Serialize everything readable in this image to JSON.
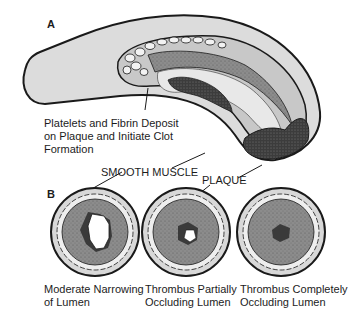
{
  "panels": {
    "a": {
      "letter": "A",
      "annotation": "Platelets and Fibrin Deposit\non Plaque and Initiate Clot\nFormation",
      "annotation_lines": [
        "Platelets and Fibrin Deposit",
        "on Plaque and Initiate Clot",
        "Formation"
      ]
    },
    "b": {
      "letter": "B",
      "labels": {
        "smooth_muscle": "SMOOTH MUSCLE",
        "plaque": "PLAQUE"
      },
      "cross_sections": [
        {
          "caption_lines": [
            "Moderate Narrowing",
            "of Lumen"
          ]
        },
        {
          "caption_lines": [
            "Thrombus Partially",
            "Occluding Lumen"
          ]
        },
        {
          "caption_lines": [
            "Thrombus Completely",
            "Occluding Lumen"
          ]
        }
      ]
    }
  },
  "colors": {
    "outline": "#1a1a1a",
    "vessel_wall": "#d8d8d8",
    "plaque": "#8a8a8a",
    "thrombus": "#3a3a3a",
    "lumen": "#ffffff"
  }
}
